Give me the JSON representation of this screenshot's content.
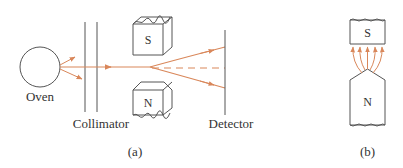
{
  "figure_a": {
    "oven_label": "Oven",
    "collimator_label": "Collimator",
    "detector_label": "Detector",
    "south_pole_label": "S",
    "north_pole_label": "N",
    "caption": "(a)"
  },
  "figure_b": {
    "south_pole_label": "S",
    "north_pole_label": "N",
    "caption": "(b)"
  },
  "colors": {
    "beam": "#d9875a",
    "outline": "#555555"
  }
}
